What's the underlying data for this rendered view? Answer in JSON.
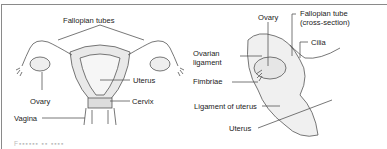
{
  "figure": {
    "left_panel": {
      "labels": {
        "fallopian_tubes": "Fallopian tubes",
        "uterus": "Uterus",
        "cervix": "Cervix",
        "ovary": "Ovary",
        "vagina": "Vagina"
      }
    },
    "right_panel": {
      "labels": {
        "ovary": "Ovary",
        "fallopian_tube_line1": "Fallopian tube",
        "fallopian_tube_line2": "(cross-section)",
        "cilia": "Cilia",
        "ovarian_ligament_line1": "Ovarian",
        "ovarian_ligament_line2": "ligament",
        "fimbriae": "Fimbriae",
        "ligament_of_uterus": "Ligament of uterus",
        "uterus": "Uterus"
      }
    },
    "caption_truncated": "F▪▪▪▪▪▪ ▪▪ ▪▪▪▪"
  }
}
